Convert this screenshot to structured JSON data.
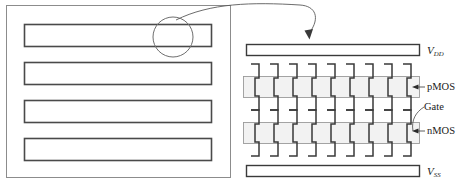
{
  "figure": {
    "type": "cmos-interdigitated-layout-diagram",
    "left_panel": {
      "name": "chip-overview-panel",
      "bar_count": 4,
      "highlight": {
        "name": "zoom-circle",
        "label": ""
      }
    },
    "right_panel": {
      "name": "cmos-cell-detail",
      "finger_count_pmos": 9,
      "finger_count_nmos": 9
    }
  },
  "labels": {
    "vdd": {
      "base": "V",
      "sub": "DD"
    },
    "vss": {
      "base": "V",
      "sub": "SS"
    },
    "pmos": "pMOS",
    "gate": "Gate",
    "nmos": "nMOS"
  },
  "colors": {
    "stroke": "#3a3a3a",
    "stroke_light": "#8c8c8c",
    "active_fill": "#f2f2f2",
    "active_stroke": "#9a9a9a",
    "text": "#1a1a1a",
    "background": "#ffffff"
  }
}
